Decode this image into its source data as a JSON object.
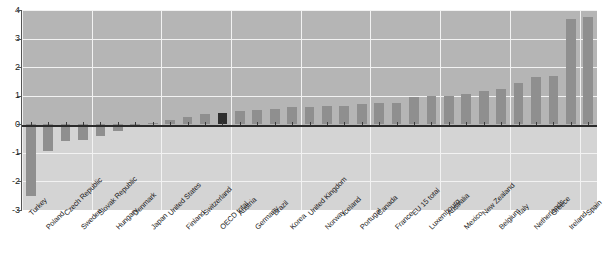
{
  "chart_data": {
    "type": "bar",
    "title": "",
    "subtitle": "",
    "xlabel": "",
    "ylabel": "",
    "ylim": [
      -3,
      4
    ],
    "yticks": [
      -3,
      -2,
      -1,
      0,
      1,
      2,
      3,
      4
    ],
    "ytick_labels": [
      "-3",
      "-2",
      "-1",
      "0",
      "1",
      "2",
      "3",
      "4"
    ],
    "grid": true,
    "legend": "none",
    "highlight_category": "OECD total",
    "colors": {
      "bar": "#8f8f8f",
      "bar_highlight": "#2e2e2e",
      "plot_background_positive": "#b5b5b5",
      "plot_background_negative": "#d4d4d4",
      "gridline": "#f2f2f2",
      "zero_line": "#2b2b2b",
      "axis": "#555555",
      "text": "#1a1a1a"
    },
    "categories": [
      "Turkey",
      "Poland",
      "Czech Republic",
      "Sweden",
      "Slovak Republic",
      "Hungary",
      "Denmark",
      "Japan",
      "United States",
      "Finland",
      "Switzerland",
      "OECD total",
      "Austria",
      "Germany",
      "Brazil",
      "Korea",
      "United Kingdom",
      "Norway",
      "Iceland",
      "Portugal",
      "Canada",
      "France",
      "EU 15 total",
      "Luxembourg",
      "Australia",
      "Mexico",
      "New Zealand",
      "Belgium",
      "Italy",
      "Netherlands",
      "Greece",
      "Ireland",
      "Spain"
    ],
    "values": [
      -2.5,
      -0.95,
      -0.6,
      -0.55,
      -0.4,
      -0.25,
      -0.03,
      0.05,
      0.15,
      0.25,
      0.35,
      0.4,
      0.45,
      0.5,
      0.55,
      0.6,
      0.6,
      0.65,
      0.65,
      0.7,
      0.75,
      0.75,
      0.95,
      1.0,
      1.0,
      1.05,
      1.15,
      1.25,
      1.45,
      1.65,
      1.7,
      3.7,
      3.75
    ]
  }
}
